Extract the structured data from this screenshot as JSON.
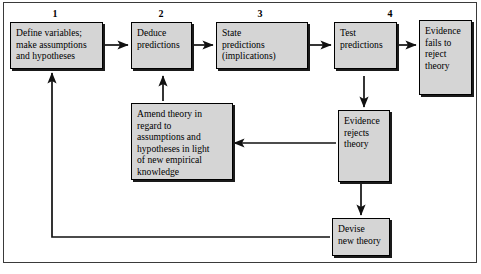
{
  "diagram": {
    "box_fill": "#d5d5d5",
    "box_border": "#000000",
    "frame_border": "#3a3a3a",
    "step_numbers": [
      "1",
      "2",
      "3",
      "4"
    ],
    "nodes": [
      {
        "id": "define-variables",
        "label": "Define variables;\nmake assumptions\nand hypotheses",
        "step": "1"
      },
      {
        "id": "deduce-predictions",
        "label": "Deduce\npredictions",
        "step": "2"
      },
      {
        "id": "state-predictions",
        "label": "State\npredictions\n(implications)",
        "step": "3"
      },
      {
        "id": "test-predictions",
        "label": "Test\npredictions",
        "step": "4"
      },
      {
        "id": "evidence-fails-to-reject",
        "label": "Evidence\nfails to\nreject\ntheory",
        "step": ""
      },
      {
        "id": "evidence-rejects",
        "label": "Evidence\nrejects\ntheory",
        "step": ""
      },
      {
        "id": "amend-theory",
        "label": "Amend theory in regard to\nassumptions and\nhypotheses in light\nof new empirical\nknowledge",
        "step": ""
      },
      {
        "id": "devise-new-theory",
        "label": "Devise\nnew theory",
        "step": ""
      }
    ],
    "connectors": [
      {
        "id": "define-to-deduce",
        "kind": "arrow-right"
      },
      {
        "id": "deduce-to-state",
        "kind": "arrow-right"
      },
      {
        "id": "state-to-test",
        "kind": "arrow-right"
      },
      {
        "id": "test-to-evidence-fails",
        "kind": "arrow-right"
      },
      {
        "id": "test-to-evidence-rejects",
        "kind": "arrow-down"
      },
      {
        "id": "evidence-rejects-to-amend",
        "kind": "arrow-left"
      },
      {
        "id": "amend-to-deduce",
        "kind": "arrow-up"
      },
      {
        "id": "evidence-rejects-to-devise",
        "kind": "arrow-down"
      },
      {
        "id": "devise-to-define-feedback",
        "kind": "elbow-arrow-up"
      }
    ]
  }
}
